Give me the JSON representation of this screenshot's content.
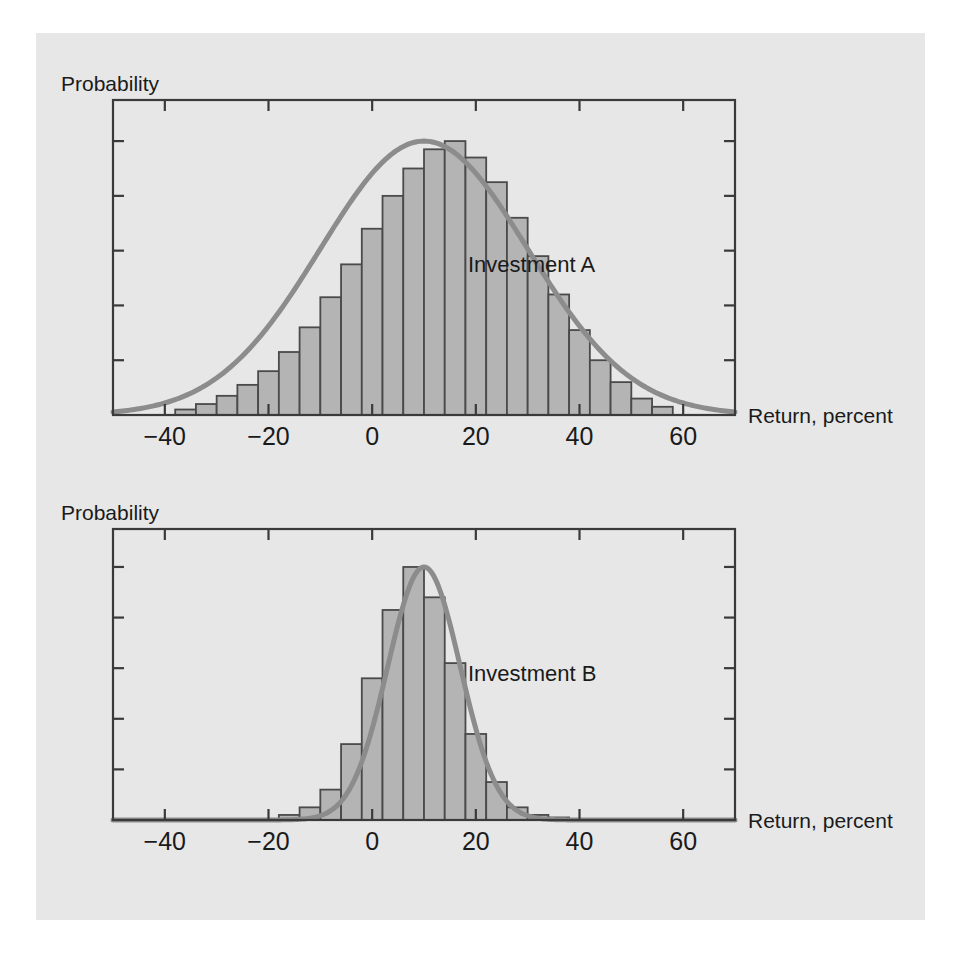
{
  "figure": {
    "background_color": "#ffffff",
    "panel_color": "#e7e7e7",
    "bar_fill_color": "#b4b4b4",
    "bar_stroke_color": "#4a4a4a",
    "curve_color": "#8c8c8c",
    "axis_color": "#3a3a3a"
  },
  "chart_a": {
    "y_axis_label": "Probability",
    "x_axis_label": "Return, percent",
    "series_label": "Investment A"
  },
  "chart_b": {
    "y_axis_label": "Probability",
    "x_axis_label": "Return, percent",
    "series_label": "Investment B"
  },
  "chart_data": [
    {
      "type": "bar",
      "title": "Investment A",
      "subtitle": "",
      "xlabel": "Return, percent",
      "ylabel": "Probability",
      "xlim": [
        -50,
        70
      ],
      "ylim": [
        0,
        1.15
      ],
      "grid": false,
      "legend": "none",
      "annotations": [
        "Investment A"
      ],
      "xtick_labels": [
        "-40",
        "-20",
        "0",
        "20",
        "40",
        "60"
      ],
      "xtick_values": [
        -40,
        -20,
        0,
        20,
        40,
        60
      ],
      "ytick_labels": [
        "",
        "",
        "",
        "",
        "",
        ""
      ],
      "ytick_values": [
        0.0,
        0.2,
        0.4,
        0.6,
        0.8,
        1.0
      ],
      "bin_width": 4,
      "bin_centers": [
        -36,
        -32,
        -28,
        -24,
        -20,
        -16,
        -12,
        -8,
        -4,
        0,
        4,
        8,
        12,
        16,
        20,
        24,
        28,
        32,
        36,
        40,
        44,
        48,
        52,
        56
      ],
      "values": [
        0.02,
        0.04,
        0.07,
        0.11,
        0.16,
        0.23,
        0.32,
        0.43,
        0.55,
        0.68,
        0.8,
        0.9,
        0.97,
        1.0,
        0.94,
        0.85,
        0.72,
        0.58,
        0.44,
        0.31,
        0.2,
        0.12,
        0.06,
        0.03
      ],
      "overlay_curve": {
        "name": "normal density",
        "mean": 10,
        "std_dev": 20,
        "peak": 1.0
      }
    },
    {
      "type": "bar",
      "title": "Investment B",
      "subtitle": "",
      "xlabel": "Return, percent",
      "ylabel": "Probability",
      "xlim": [
        -50,
        70
      ],
      "ylim": [
        0,
        1.15
      ],
      "grid": false,
      "legend": "none",
      "annotations": [
        "Investment B"
      ],
      "xtick_labels": [
        "-40",
        "-20",
        "0",
        "20",
        "40",
        "60"
      ],
      "xtick_values": [
        -40,
        -20,
        0,
        20,
        40,
        60
      ],
      "ytick_labels": [
        "",
        "",
        "",
        "",
        "",
        ""
      ],
      "ytick_values": [
        0.0,
        0.2,
        0.4,
        0.6,
        0.8,
        1.0
      ],
      "bin_width": 4,
      "bin_centers": [
        -16,
        -12,
        -8,
        -4,
        0,
        4,
        8,
        12,
        16,
        20,
        24,
        28,
        32,
        36
      ],
      "values": [
        0.02,
        0.05,
        0.12,
        0.3,
        0.56,
        0.83,
        1.0,
        0.88,
        0.62,
        0.34,
        0.15,
        0.05,
        0.02,
        0.01
      ],
      "overlay_curve": {
        "name": "normal density",
        "mean": 10,
        "std_dev": 7,
        "peak": 1.0
      }
    }
  ]
}
